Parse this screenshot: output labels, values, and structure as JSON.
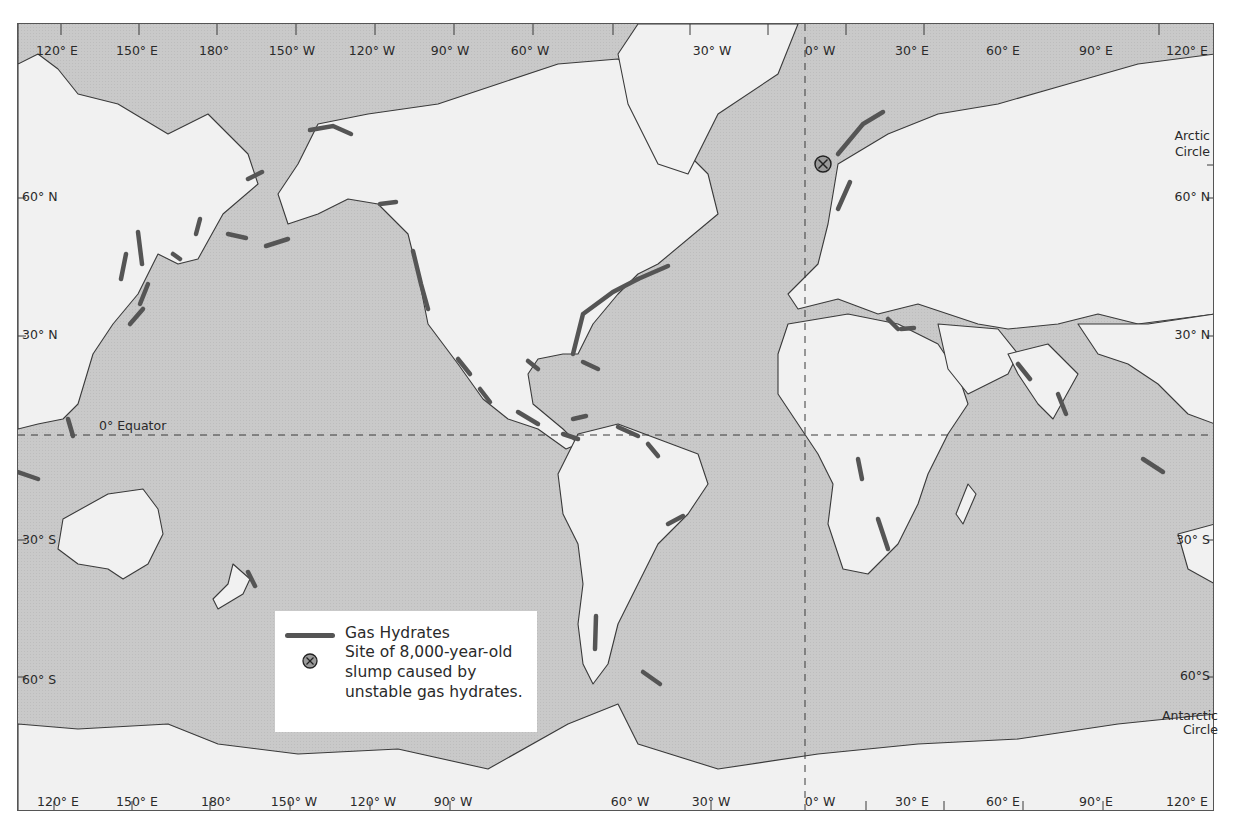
{
  "map": {
    "projection": "Mercator world map, Pacific-centered edges (120° E to 120° E)",
    "colors": {
      "ocean": "#c9c9c9",
      "land": "#f1f1f1",
      "coastline": "#3a3a3a",
      "gas_hydrate": "#555555",
      "frame": "#555555",
      "text": "#2a2a2a"
    },
    "longitude_labels_top": [
      "120° E",
      "150° E",
      "180°",
      "150° W",
      "120° W",
      "90° W",
      "60° W",
      "30° W",
      "0° W",
      "30° E",
      "60° E",
      "90° E",
      "120° E"
    ],
    "longitude_labels_bottom": [
      "120° E",
      "150° E",
      "180°",
      "150° W",
      "120° W",
      "90° W",
      "60° W",
      "30° W",
      "0° W",
      "30° E",
      "60° E",
      "90° E",
      "120° E"
    ],
    "latitude_labels_left": [
      "60° N",
      "30° N",
      "30° S",
      "60° S"
    ],
    "latitude_labels_right": [
      "60° N",
      "30° N",
      "30° S",
      "60°S"
    ],
    "arctic_circle": [
      "Arctic",
      "Circle"
    ],
    "antarctic_circle": [
      "Antarctic",
      "Circle"
    ],
    "equator_label": "0° Equator"
  },
  "legend": {
    "gas_hydrates_label": "Gas Hydrates",
    "slump_site_lines": [
      "Site of 8,000-year-old",
      "slump caused by",
      "unstable gas hydrates."
    ],
    "gas_hydrates_icon": "thick-gray-line",
    "slump_site_icon": "circled-x-icon"
  },
  "features": {
    "gas_hydrate_regions": [
      "Sea of Okhotsk / Sakhalin",
      "Japan Pacific margin",
      "Kamchatka",
      "Bering Sea",
      "Aleutian Trench",
      "Alaska North Slope / Beaufort Sea",
      "Gulf of Alaska",
      "Cascadia margin",
      "Mexico Pacific margin",
      "Middle America Trench",
      "Gulf of Mexico",
      "Blake Ridge / US Atlantic margin",
      "Nova Scotia margin",
      "Caribbean",
      "Colombia / Panama",
      "Venezuela",
      "Peru",
      "Chile margin",
      "Brazil margin",
      "Falkland / Scotia Sea",
      "Norway margin",
      "Barents Sea",
      "Mediterranean",
      "Black Sea",
      "Oman / Makran",
      "India west margin",
      "Congo / West Africa",
      "Namibia",
      "Sumatra / Indonesia",
      "New Zealand",
      "Philippines"
    ],
    "slump_site": "Storegga Slide (off Norway)"
  }
}
